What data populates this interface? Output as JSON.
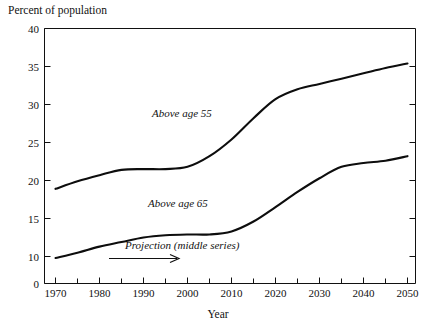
{
  "chart_data": {
    "type": "line",
    "title": "",
    "ylabel": "Percent of population",
    "xlabel": "Year",
    "xlim": [
      1970,
      2050
    ],
    "ylim": [
      0,
      40
    ],
    "y_axis_broken": true,
    "y_break_note": "axis compressed between 0 and 10",
    "grid": false,
    "legend_position": "inline-annotation",
    "y_ticks": [
      "40",
      "35",
      "30",
      "25",
      "20",
      "15",
      "10",
      "0"
    ],
    "y_tick_values": [
      40,
      35,
      30,
      25,
      20,
      15,
      10,
      0
    ],
    "x_ticks": [
      "1970",
      "1980",
      "1990",
      "2000",
      "2010",
      "2020",
      "2030",
      "2040",
      "2050"
    ],
    "x_tick_values": [
      1970,
      1980,
      1990,
      2000,
      2010,
      2020,
      2030,
      2040,
      2050
    ],
    "x_minor_tick_values": [
      1975,
      1985,
      1995,
      2005,
      2015,
      2025,
      2035,
      2045
    ],
    "x": [
      1970,
      1975,
      1980,
      1985,
      1990,
      1995,
      2000,
      2005,
      2010,
      2015,
      2020,
      2025,
      2030,
      2035,
      2040,
      2045,
      2050
    ],
    "series": [
      {
        "name": "Above age 55",
        "label": "Above age 55",
        "values": [
          18.9,
          19.9,
          20.7,
          21.4,
          21.5,
          21.5,
          21.8,
          23.2,
          25.4,
          28.2,
          30.7,
          32.0,
          32.7,
          33.4,
          34.1,
          34.8,
          35.4
        ]
      },
      {
        "name": "Above age 65",
        "label": "Above age 65",
        "values": [
          9.8,
          10.5,
          11.3,
          11.9,
          12.5,
          12.8,
          12.9,
          12.9,
          13.3,
          14.6,
          16.5,
          18.5,
          20.3,
          21.8,
          22.3,
          22.6,
          23.2
        ]
      }
    ],
    "annotations": [
      {
        "text": "Above age 55",
        "x": 1995,
        "y": 26.5
      },
      {
        "text": "Above age 65",
        "x": 1995,
        "y": 15.8
      },
      {
        "text": "Projection (middle series)",
        "x": 1999,
        "y": 10.8,
        "arrow": {
          "from_x": 1987,
          "to_x": 2005,
          "direction": "right"
        }
      }
    ]
  },
  "axis_labels": {
    "y_title": "Percent of population",
    "x_title": "Year"
  },
  "colors": {
    "background": "#ffffff",
    "axis": "#111111",
    "curve": "#0d0d0d",
    "text": "#111111"
  }
}
